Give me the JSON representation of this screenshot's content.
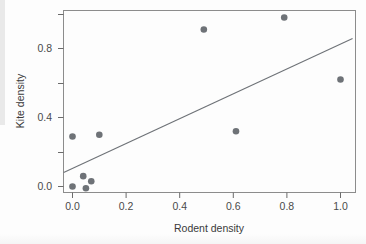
{
  "chart_data": {
    "type": "scatter",
    "title": "",
    "xlabel": "Rodent density",
    "ylabel": "Kite density",
    "xlim": [
      -0.08,
      1.09
    ],
    "ylim": [
      -0.08,
      1.03
    ],
    "grid": false,
    "legend": null,
    "x": [
      0.0,
      0.1,
      0.0,
      0.04,
      0.05,
      0.07,
      0.49,
      0.61,
      0.79,
      1.0
    ],
    "y": [
      0.29,
      0.3,
      0.0,
      0.06,
      -0.01,
      0.03,
      0.91,
      0.32,
      0.98,
      0.62
    ],
    "points": [
      {
        "x": 0.0,
        "y": 0.29
      },
      {
        "x": 0.1,
        "y": 0.3
      },
      {
        "x": 0.0,
        "y": 0.0
      },
      {
        "x": 0.04,
        "y": 0.06
      },
      {
        "x": 0.05,
        "y": -0.01
      },
      {
        "x": 0.07,
        "y": 0.03
      },
      {
        "x": 0.49,
        "y": 0.91
      },
      {
        "x": 0.61,
        "y": 0.32
      },
      {
        "x": 0.79,
        "y": 0.98
      },
      {
        "x": 1.0,
        "y": 0.62
      }
    ],
    "trendline": {
      "type": "linear",
      "x_start": -0.033,
      "y_start": 0.081,
      "x_end": 1.045,
      "y_end": 0.858,
      "slope": 0.721,
      "intercept": 0.105
    },
    "x_ticks": [
      {
        "value": 0.0,
        "label": "0.0"
      },
      {
        "value": 0.2,
        "label": "0.2"
      },
      {
        "value": 0.4,
        "label": "0.4"
      },
      {
        "value": 0.6,
        "label": "0.6"
      },
      {
        "value": 0.8,
        "label": "0.8"
      },
      {
        "value": 1.0,
        "label": "1.0"
      }
    ],
    "y_ticks": [
      {
        "value": 0.0,
        "label": "0.0"
      },
      {
        "value": 0.2,
        "label": ""
      },
      {
        "value": 0.4,
        "label": "0.4"
      },
      {
        "value": 0.6,
        "label": ""
      },
      {
        "value": 0.8,
        "label": "0.8"
      },
      {
        "value": 1.0,
        "label": ""
      }
    ],
    "colors": {
      "point": "#6e7277",
      "line": "#6e7277",
      "axis": "#6b6b6b",
      "frame": "#8c8c8c",
      "text": "#4a4a4a",
      "background": "#fdfdfd"
    }
  },
  "axis_labels": {
    "x_title": "Rodent density",
    "y_title": "Kite density",
    "x_tick_0": "0.0",
    "x_tick_1": "0.2",
    "x_tick_2": "0.4",
    "x_tick_3": "0.6",
    "x_tick_4": "0.8",
    "x_tick_5": "1.0",
    "y_tick_0": "0.0",
    "y_tick_1": "0.4",
    "y_tick_2": "0.8"
  }
}
